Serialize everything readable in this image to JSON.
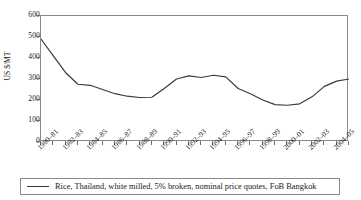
{
  "chart_data": {
    "type": "line",
    "title": "",
    "subtitle": "",
    "xlabel": "",
    "ylabel": "US $/MT",
    "ylim": [
      0,
      600
    ],
    "yticks": [
      0,
      100,
      200,
      300,
      400,
      500,
      600
    ],
    "grid": false,
    "legend_position": "bottom",
    "x_tick_labels": [
      "1980–81",
      "1982–83",
      "1984–85",
      "1986–87",
      "1988–89",
      "1990–91",
      "1992–93",
      "1994–95",
      "1996–97",
      "1998–99",
      "2000–01",
      "2002–03",
      "2004–05"
    ],
    "x": [
      "1980–81",
      "1981–82",
      "1982–83",
      "1983–84",
      "1984–85",
      "1985–86",
      "1986–87",
      "1987–88",
      "1988–89",
      "1989–90",
      "1990–91",
      "1991–92",
      "1992–93",
      "1993–94",
      "1994–95",
      "1995–96",
      "1996–97",
      "1997–98",
      "1998–99",
      "1999–00",
      "2000–01",
      "2001–02",
      "2002–03",
      "2003–04",
      "2004–05",
      "2005–06"
    ],
    "series": [
      {
        "name": "Rice, Thailand, white milled, 5% broken, nominal price quotes, FoB Bangkok",
        "color": "#3a3a3a",
        "values": [
          490,
          410,
          330,
          275,
          270,
          250,
          230,
          218,
          212,
          213,
          255,
          300,
          315,
          307,
          318,
          310,
          315,
          320,
          305,
          252,
          300,
          390,
          320,
          335,
          325,
          312
        ]
      }
    ],
    "series_note": "annual values read off axis; final segment declines then rises",
    "values_right_tail": [
      255,
      230,
      200,
      178,
      175,
      182,
      215,
      265,
      290,
      300
    ]
  },
  "legend": {
    "entries": [
      {
        "label": "Rice, Thailand, white milled, 5% broken, nominal price quotes, FoB Bangkok",
        "swatch": "line-swatch",
        "color": "#3a3a3a"
      }
    ]
  },
  "axis": {
    "y_title": "US $/MT",
    "y_tick_labels": [
      "600",
      "500",
      "400",
      "300",
      "200",
      "100",
      "0"
    ]
  }
}
